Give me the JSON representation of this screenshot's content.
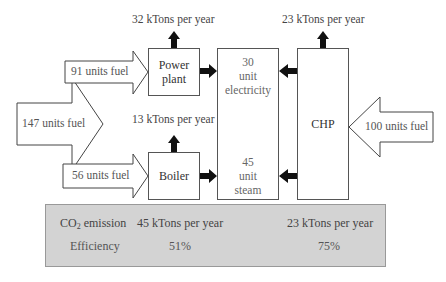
{
  "diagram": {
    "power_plant": {
      "label_line1": "Power",
      "label_line2": "plant",
      "fuel_in": "91 units fuel",
      "emission": "32 kTons per year"
    },
    "boiler": {
      "label": "Boiler",
      "fuel_in": "56 units fuel",
      "emission": "13 kTons per year"
    },
    "separate_total_fuel": "147 units fuel",
    "demand": {
      "electricity": {
        "value": "30",
        "unit": "unit",
        "name": "electricity"
      },
      "steam": {
        "value": "45",
        "unit": "unit",
        "name": "steam"
      }
    },
    "chp": {
      "label": "CHP",
      "fuel_in": "100 units fuel",
      "emission": "23 kTons per year"
    }
  },
  "summary": {
    "rows": [
      {
        "label_prefix": "CO",
        "label_sub": "2",
        "label_suffix": " emission",
        "separate": "45 kTons per year",
        "chp": "23 kTons per year"
      },
      {
        "label": "Efficiency",
        "separate": "51%",
        "chp": "75%"
      }
    ]
  },
  "colors": {
    "summary_bg": "#d3d3d3",
    "arrow_fill": "#111111",
    "box_border": "#555555"
  }
}
